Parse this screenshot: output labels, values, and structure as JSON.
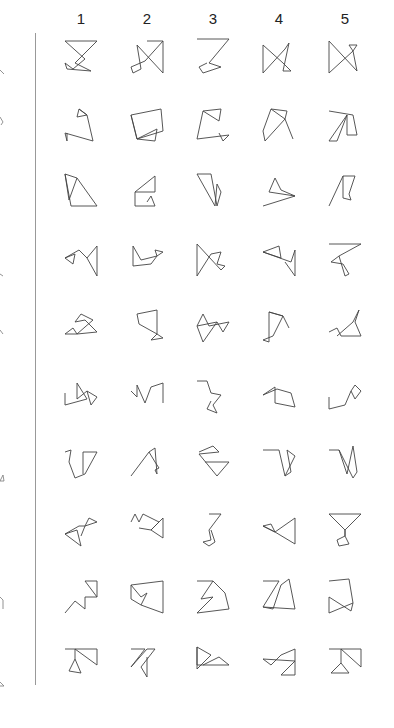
{
  "columns": {
    "labels": [
      "1",
      "2",
      "3",
      "4",
      "5"
    ],
    "x": [
      81,
      147,
      213,
      279,
      345
    ]
  },
  "rows_y": [
    57,
    125,
    190,
    260,
    326,
    397,
    462,
    530,
    597,
    665
  ],
  "left_fragments_y": [
    70,
    117,
    272,
    330,
    475,
    597,
    682
  ],
  "figures": [
    [
      "4,4 36,4 14,26 30,34 6,32 4,26 12,32 24,22 4,4",
      "20,4 36,4 18,24 4,30 6,36 14,32 10,8 36,36 36,4",
      "4,2 36,2 16,26 28,30 10,36 6,30 14,26",
      "4,8 4,36 26,12 30,6 24,34 32,34 24,26 4,8",
      "4,4 4,36 28,14 24,8 32,8 28,14 32,34 4,4"
    ],
    [
      "18,4 26,10 16,12 18,4 26,10 32,36 4,28 6,36 6,28",
      "4,10 34,4 36,26 10,34 4,10 10,34 30,24 28,36 10,34",
      "10,6 28,4 26,16 10,6 4,34 36,30 30,36 26,28",
      "12,4 28,6 26,14 12,4 4,26 6,36 26,14 34,34",
      "4,6 28,10 32,30 22,30 22,10 4,36 12,36 22,10"
    ],
    [
      "4,4 16,8 8,30 4,4 10,36 36,36 16,8",
      "8,22 28,6 28,22 8,22 8,36 28,36 24,26 20,32",
      "4,4 18,4 24,36 28,22 24,14 22,36 4,4",
      "4,36 36,26 22,20 16,8 10,22 36,26",
      "4,36 18,6 30,6 24,24 26,30 18,28 18,6"
    ],
    [
      "4,18 14,14 12,24 4,18 18,10 26,18 36,6 36,36 26,18",
      "6,6 14,20 30,16 28,10 36,12 30,16 24,24 6,26 6,6",
      "4,4 4,36 18,14 28,12 24,24 32,26 28,30 4,4",
      "4,12 20,6 22,18 4,12 32,22 36,10 36,36 26,22",
      "4,4 36,4 14,16 6,22 18,24 24,34 20,36 14,16"
    ],
    [
      "4,28 12,22 16,28 32,14 20,8 14,16 24,14 36,26 16,28 4,28",
      "10,8 30,4 30,28 36,32 24,34 30,28 12,18 10,8",
      "4,20 10,8 16,20 36,16 30,26 24,16 4,20 10,36 24,16",
      "10,6 24,10 14,30 4,34 10,36 10,6 24,10 30,22",
      "4,26 12,22 16,30 36,30 30,16 34,4 28,16 12,30"
    ],
    [
      "4,16 4,28 26,22 16,6 16,22 26,14 36,20 30,28 26,14",
      "4,14 10,20 10,8 18,26 24,10 36,6 36,26",
      "4,4 14,4 18,16 28,18 20,28 24,36 14,32 18,24",
      "4,18 16,10 16,26 36,30 32,16 18,12 4,18",
      "4,20 4,32 20,28 26,14 30,22 36,14 30,8 26,14"
    ],
    [
      "4,10 10,8 8,20 14,36 24,32 36,10 22,10 22,32",
      "4,34 22,10 28,6 30,32 28,28 32,26 28,20 22,10",
      "6,10 20,4 26,10 6,12 24,34 36,20 12,20",
      "4,8 20,8 26,34 32,30 28,8 36,14 26,34",
      "4,8 14,8 22,32 28,4 32,30 28,36 14,8"
    ],
    [
      "4,24 16,20 20,36 4,24 18,16 24,16 28,8 36,12 24,16 20,26",
      "4,12 8,4 12,12 16,4 32,12 24,20 36,28 36,8 24,20 12,18",
      "16,4 28,4 16,20 18,30 10,32 16,36 22,32 18,20",
      "4,16 12,14 16,22 4,16 16,22 36,8 36,34 16,22",
      "4,4 36,4 20,20 20,26 12,30 14,36 24,34 20,26 20,20 4,4"
    ],
    [
      "4,36 14,24 24,32 24,20 36,20 36,4 24,4 36,20",
      "4,8 36,4 36,36 14,28 20,16 14,20 4,8 4,22 14,28",
      "4,4 20,4 8,22 20,20 4,36 36,32 32,16 20,4",
      "4,4 20,4 4,30 14,32 22,8 30,2 36,32 4,30",
      "4,4 24,2 28,26 4,36 4,20 26,34 28,26"
    ],
    [
      "4,4 36,4 36,20 14,4 14,14 8,26 20,28 14,14",
      "4,4 18,4 4,22 20,4 28,4 14,22 20,32 20,12",
      "4,2 18,10 4,24 4,2 4,20 36,20 26,12 10,20",
      "4,14 12,20 22,10 36,4 36,30 22,30 36,16 4,14",
      "4,4 36,4 36,22 16,4 16,18 6,28 24,28 16,18"
    ]
  ],
  "left_fragments": [
    "0,0 4,4",
    "0,0 3,5 1,8",
    "0,2 3,4",
    "0,0 3,4",
    "0,6 3,0 4,6 0,6",
    "0,0 3,3 3,12",
    "0,0 4,4 0,4"
  ]
}
